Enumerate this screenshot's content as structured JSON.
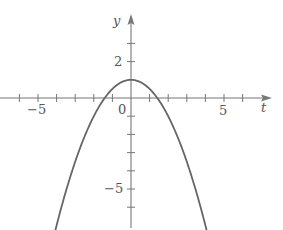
{
  "chart_data": {
    "type": "line",
    "title": "",
    "xlabel": "t",
    "ylabel": "y",
    "function": "y = 1 - t^2/2",
    "xlim": [
      -7,
      7.5
    ],
    "ylim": [
      -7,
      4
    ],
    "x_ticks": [
      -6,
      -5,
      -4,
      -3,
      -2,
      -1,
      1,
      2,
      3,
      4,
      5,
      6
    ],
    "y_ticks": [
      3,
      2,
      -1,
      -2,
      -3,
      -4,
      -5,
      -6
    ],
    "x_tick_labels": [
      {
        "value": -5,
        "text": "−5"
      },
      {
        "value": 5,
        "text": "5"
      }
    ],
    "y_tick_labels": [
      {
        "value": 2,
        "text": "2"
      },
      {
        "value": -5,
        "text": "−5"
      }
    ],
    "origin_label": "0",
    "grid": false,
    "series": [
      {
        "name": "parabola",
        "x": [
          -4.1,
          -3.5,
          -3,
          -2.5,
          -2,
          -1.5,
          -1.41,
          -1,
          -0.5,
          0,
          0.5,
          1,
          1.41,
          1.5,
          2,
          2.5,
          3,
          3.5,
          4.1
        ],
        "values": [
          -7.4,
          -5.13,
          -3.5,
          -2.13,
          -1,
          -0.13,
          0,
          0.5,
          0.88,
          1,
          0.88,
          0.5,
          0,
          -0.13,
          -1,
          -2.13,
          -3.5,
          -5.13,
          -7.4
        ]
      }
    ],
    "colors": {
      "axis": "#777777",
      "curve": "#666666",
      "text": "#555555"
    }
  },
  "labels": {
    "x_axis": "t",
    "y_axis": "y",
    "origin": "0",
    "x_neg5": "−5",
    "x_pos5": "5",
    "y_pos2": "2",
    "y_neg5": "−5"
  }
}
